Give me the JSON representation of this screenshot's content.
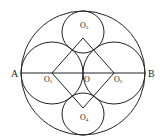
{
  "diagram": {
    "type": "geometry",
    "stroke_color": "#222222",
    "background": "#ffffff",
    "points": {
      "A": {
        "label": "A"
      },
      "B": {
        "label": "B"
      },
      "O": {
        "label": "O"
      },
      "O1": {
        "label": "O",
        "sub": "1"
      },
      "O2": {
        "label": "O",
        "sub": "2"
      },
      "O3": {
        "label": "O",
        "sub": "3"
      },
      "O4": {
        "label": "O",
        "sub": "4"
      }
    },
    "circles": [
      {
        "name": "big-circle",
        "center": "O"
      },
      {
        "name": "circle-O1",
        "center": "O1"
      },
      {
        "name": "circle-O2",
        "center": "O2"
      },
      {
        "name": "circle-O3",
        "center": "O3"
      },
      {
        "name": "circle-O4",
        "center": "O4"
      }
    ],
    "segments": [
      "AB",
      "O1O3",
      "O3O2",
      "O2O4",
      "O4O1"
    ]
  }
}
